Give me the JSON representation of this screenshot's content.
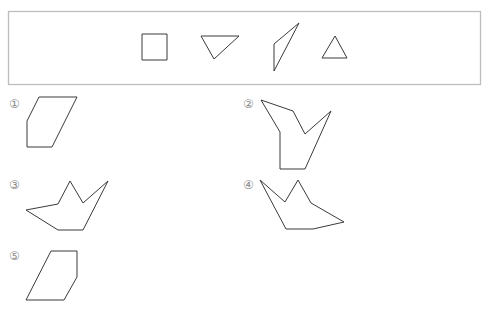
{
  "frame": {
    "x": 8.5,
    "y": 11.5,
    "w": 472,
    "h": 73,
    "stroke": "#bdbdbd"
  },
  "reference_pieces": [
    {
      "name": "square",
      "points": "142,34 167,34 167,60 142,60"
    },
    {
      "name": "inverted-right-triangle",
      "points": "201,36 239,36 214,59"
    },
    {
      "name": "thin-triangle-quad",
      "points": "299,23 274,44 274,71"
    },
    {
      "name": "equilateral-triangle",
      "points": "335,36 347,58 322,58"
    }
  ],
  "options": [
    {
      "label": "①",
      "label_x": 9,
      "label_y": 108,
      "points": "39,97 77,97 52,147 27,147 27,121"
    },
    {
      "label": "②",
      "label_x": 243,
      "label_y": 108,
      "points": "261,100 293,111 305,134 331,111 305,169 280,169 280,132"
    },
    {
      "label": "③",
      "label_x": 9,
      "label_y": 189,
      "points": "70,181 83,203 108,181 83,230 58,230 26,210 58,204"
    },
    {
      "label": "④",
      "label_x": 243,
      "label_y": 189,
      "points": "260,180 285,202 298,180 311,203 344,222 313,229 286,229"
    },
    {
      "label": "⑤",
      "label_x": 9,
      "label_y": 260,
      "points": "51,251 77,251 77,277 64,300 26,300"
    }
  ],
  "colors": {
    "stroke": "#3a3a3a",
    "label": "#8a8a8a",
    "frame": "#bdbdbd"
  }
}
